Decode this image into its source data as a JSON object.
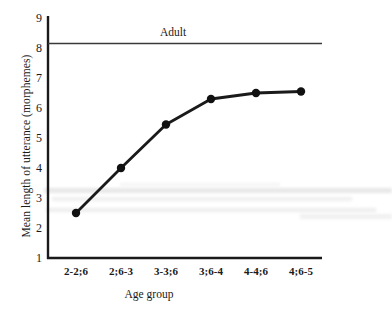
{
  "chart_data": {
    "type": "line",
    "title": "",
    "xlabel": "Age group",
    "ylabel": "Mean length of utterance (morphemes)",
    "categories": [
      "2-2;6",
      "2;6-3",
      "3-3;6",
      "3;6-4",
      "4-4;6",
      "4;6-5"
    ],
    "values": [
      2.5,
      4.0,
      5.45,
      6.3,
      6.5,
      6.55
    ],
    "ylim": [
      1,
      9
    ],
    "yticks": [
      "1",
      "2",
      "3",
      "4",
      "5",
      "6",
      "7",
      "8",
      "9"
    ],
    "ytick_values": [
      1,
      2,
      3,
      4,
      5,
      6,
      7,
      8,
      9
    ],
    "grid": false,
    "legend": "none",
    "series": [
      {
        "name": "Mean length of utterance",
        "values": [
          2.5,
          4.0,
          5.45,
          6.3,
          6.5,
          6.55
        ],
        "marker": "filled-circle",
        "color": "#1a1a1a"
      }
    ],
    "annotations": [
      {
        "name": "adult-reference-line",
        "label": "Adult",
        "type": "horizontal-line",
        "y": 8.15,
        "color": "#3a3a3a"
      }
    ]
  },
  "axes": {
    "y_label": "Mean length of utterance (morphemes)",
    "x_label": "Age group",
    "y_ticks": [
      {
        "label": "9",
        "value": 9
      },
      {
        "label": "8",
        "value": 8
      },
      {
        "label": "7",
        "value": 7
      },
      {
        "label": "6",
        "value": 6
      },
      {
        "label": "5",
        "value": 5
      },
      {
        "label": "4",
        "value": 4
      },
      {
        "label": "3",
        "value": 3
      },
      {
        "label": "2",
        "value": 2
      },
      {
        "label": "1",
        "value": 1
      }
    ],
    "x_ticks": [
      {
        "label": "2-2;6"
      },
      {
        "label": "2;6-3"
      },
      {
        "label": "3-3;6"
      },
      {
        "label": "3;6-4"
      },
      {
        "label": "4-4;6"
      },
      {
        "label": "4;6-5"
      }
    ]
  },
  "annotation": {
    "adult_label": "Adult"
  },
  "colors": {
    "line": "#1a1a1a",
    "marker": "#111111",
    "axis": "#1a1a1a",
    "adult_line": "#3a3a3a",
    "background": "#ffffff"
  }
}
